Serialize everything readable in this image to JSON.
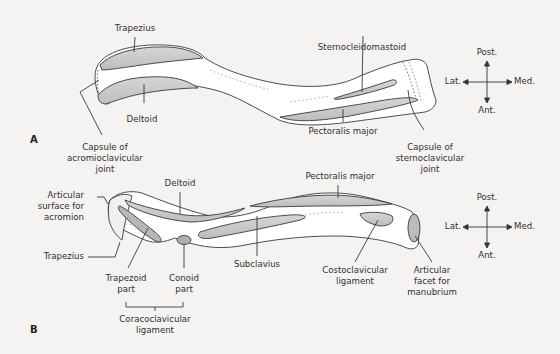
{
  "figure": {
    "panels": [
      {
        "id": "A",
        "label": "A",
        "view": "superior",
        "labels": {
          "trapezius": "Trapezius",
          "deltoid": "Deltoid",
          "capsule_ac": [
            "Capsule of",
            "acromioclavicular",
            "joint"
          ],
          "sternocleidomastoid": "Sternocleidomastoid",
          "pectoralis_major": "Pectoralis major",
          "capsule_sc": [
            "Capsule of",
            "sternoclavicular",
            "joint"
          ]
        },
        "compass": {
          "up": "Post.",
          "down": "Ant.",
          "left": "Lat.",
          "right": "Med."
        }
      },
      {
        "id": "B",
        "label": "B",
        "view": "inferior",
        "labels": {
          "articular_surface_acromion": [
            "Articular",
            "surface for",
            "acromion"
          ],
          "deltoid": "Deltoid",
          "pectoralis_major": "Pectoralis major",
          "trapezius": "Trapezius",
          "trapezoid_part": [
            "Trapezoid",
            "part"
          ],
          "conoid_part": [
            "Conoid",
            "part"
          ],
          "coracoclavicular_ligament": [
            "Coracoclavicular",
            "ligament"
          ],
          "subclavius": "Subclavius",
          "costoclavicular_ligament": [
            "Costoclavicular",
            "ligament"
          ],
          "articular_facet_manubrium": [
            "Articular",
            "facet for",
            "manubrium"
          ]
        },
        "compass": {
          "up": "Post.",
          "down": "Ant.",
          "left": "Lat.",
          "right": "Med."
        }
      }
    ],
    "colors": {
      "background": "#f4f3f1",
      "bone_fill": "#ffffff",
      "muscle_fill": "#c9c9c9",
      "line": "#3a3a3a"
    }
  }
}
